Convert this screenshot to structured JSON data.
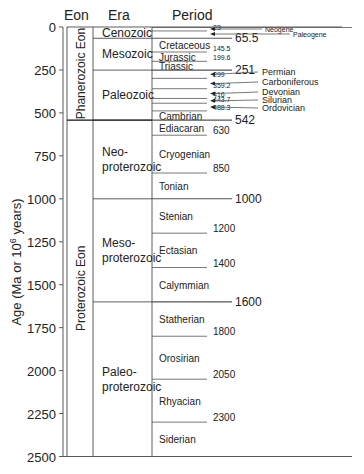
{
  "chart_data": {
    "type": "table",
    "ylabel": "Age (Ma or 10^6 years)",
    "ylabel_parts": {
      "pre": "Age (Ma or 10",
      "sup": "6",
      "post": " years)"
    },
    "ylim": [
      0,
      2500
    ],
    "yticks": [
      0,
      250,
      500,
      750,
      1000,
      1250,
      1500,
      1750,
      2000,
      2250,
      2500
    ],
    "column_headers": {
      "eon": "Eon",
      "era": "Era",
      "period": "Period"
    },
    "eons": [
      {
        "name": "Phanerozoic Eon",
        "start": 0,
        "end": 542
      },
      {
        "name": "Proterozoic Eon",
        "start": 542,
        "end": 2500
      }
    ],
    "eras": [
      {
        "name": "Cenozoic",
        "lines": [
          "Cenozoic"
        ],
        "start": 0,
        "end": 65.5
      },
      {
        "name": "Mesozoic",
        "lines": [
          "Mesozoic"
        ],
        "start": 65.5,
        "end": 251
      },
      {
        "name": "Paleozoic",
        "lines": [
          "Paleozoic"
        ],
        "start": 251,
        "end": 542
      },
      {
        "name": "Neoproterozoic",
        "lines": [
          "Neo-",
          "proterozoic"
        ],
        "start": 542,
        "end": 1000
      },
      {
        "name": "Mesoproterozoic",
        "lines": [
          "Meso-",
          "proterozoic"
        ],
        "start": 1000,
        "end": 1600
      },
      {
        "name": "Paleoproterozoic",
        "lines": [
          "Paleo-",
          "proterozoic"
        ],
        "start": 1600,
        "end": 2500
      }
    ],
    "periods": [
      {
        "name": "Neogene",
        "start": 0,
        "end": 23,
        "label_side": "right"
      },
      {
        "name": "Paleogene",
        "start": 23,
        "end": 65.5,
        "label_side": "right"
      },
      {
        "name": "Cretaceous",
        "start": 65.5,
        "end": 145.5,
        "label_side": "inside"
      },
      {
        "name": "Jurassic",
        "start": 145.5,
        "end": 199.6,
        "label_side": "inside"
      },
      {
        "name": "Triassic",
        "start": 199.6,
        "end": 251,
        "label_side": "inside"
      },
      {
        "name": "Permian",
        "start": 251,
        "end": 299,
        "label_side": "right"
      },
      {
        "name": "Carboniferous",
        "start": 299,
        "end": 359.2,
        "label_side": "right"
      },
      {
        "name": "Devonian",
        "start": 359.2,
        "end": 416,
        "label_side": "right"
      },
      {
        "name": "Silurian",
        "start": 416,
        "end": 443.7,
        "label_side": "right"
      },
      {
        "name": "Ordovician",
        "start": 443.7,
        "end": 488.3,
        "label_side": "right"
      },
      {
        "name": "Cambrian",
        "start": 488.3,
        "end": 542,
        "label_side": "inside"
      },
      {
        "name": "Ediacaran",
        "start": 542,
        "end": 630,
        "label_side": "inside"
      },
      {
        "name": "Cryogenian",
        "start": 630,
        "end": 850,
        "label_side": "inside"
      },
      {
        "name": "Tonian",
        "start": 850,
        "end": 1000,
        "label_side": "inside"
      },
      {
        "name": "Stenian",
        "start": 1000,
        "end": 1200,
        "label_side": "inside"
      },
      {
        "name": "Ectasian",
        "start": 1200,
        "end": 1400,
        "label_side": "inside"
      },
      {
        "name": "Calymmian",
        "start": 1400,
        "end": 1600,
        "label_side": "inside"
      },
      {
        "name": "Statherian",
        "start": 1600,
        "end": 1800,
        "label_side": "inside"
      },
      {
        "name": "Orosirian",
        "start": 1800,
        "end": 2050,
        "label_side": "inside"
      },
      {
        "name": "Rhyacian",
        "start": 2050,
        "end": 2300,
        "label_side": "inside"
      },
      {
        "name": "Siderian",
        "start": 2300,
        "end": 2500,
        "label_side": "inside"
      }
    ],
    "boundaries": [
      {
        "age": 23,
        "label": "23",
        "size": "small"
      },
      {
        "age": 65.5,
        "label": "65.5",
        "size": "large"
      },
      {
        "age": 145.5,
        "label": "145.5",
        "size": "small"
      },
      {
        "age": 199.6,
        "label": "199.6",
        "size": "small"
      },
      {
        "age": 251,
        "label": "251",
        "size": "large"
      },
      {
        "age": 299,
        "label": "299",
        "size": "small"
      },
      {
        "age": 359.2,
        "label": "359.2",
        "size": "small"
      },
      {
        "age": 416,
        "label": "416",
        "size": "small"
      },
      {
        "age": 443.7,
        "label": "443.7",
        "size": "small"
      },
      {
        "age": 488.3,
        "label": "488.3",
        "size": "small"
      },
      {
        "age": 542,
        "label": "542",
        "size": "large"
      },
      {
        "age": 630,
        "label": "630",
        "size": "medium"
      },
      {
        "age": 850,
        "label": "850",
        "size": "medium"
      },
      {
        "age": 1000,
        "label": "1000",
        "size": "large"
      },
      {
        "age": 1200,
        "label": "1200",
        "size": "medium"
      },
      {
        "age": 1400,
        "label": "1400",
        "size": "medium"
      },
      {
        "age": 1600,
        "label": "1600",
        "size": "large"
      },
      {
        "age": 1800,
        "label": "1800",
        "size": "medium"
      },
      {
        "age": 2050,
        "label": "2050",
        "size": "medium"
      },
      {
        "age": 2300,
        "label": "2300",
        "size": "medium"
      }
    ],
    "grid": false,
    "legend": null
  }
}
